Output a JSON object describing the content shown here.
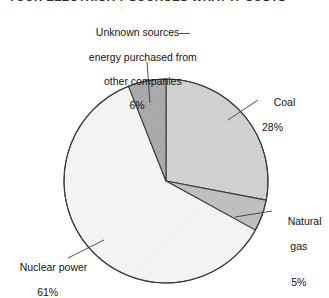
{
  "figure": {
    "title": "YOUR ELECTRICITY SOURCES     WHAT IT COSTS",
    "background": "#ffffff",
    "outline_color": "#3c3c3c"
  },
  "chart_data": {
    "type": "pie",
    "title": "YOUR ELECTRICITY SOURCES",
    "xlabel": "",
    "ylabel": "",
    "units": "percent",
    "start_angle_deg": 0,
    "direction": "clockwise",
    "center": {
      "x": 166,
      "y": 181
    },
    "radius": 102,
    "total": 100,
    "categories": [
      "Coal",
      "Natural gas",
      "Nuclear power",
      "Unknown sources—energy purchased from other companies"
    ],
    "values": [
      28,
      5,
      61,
      6
    ],
    "slices": [
      {
        "name": "coal",
        "label": "Coal",
        "value": 28,
        "percent_text": "28%",
        "color": "#cfcfcf",
        "start_deg": 0,
        "end_deg": 100.8,
        "leader": {
          "x1": 228,
          "y1": 120,
          "x2": 258,
          "y2": 100
        }
      },
      {
        "name": "natural-gas",
        "label": "Natural\ngas",
        "label_line1": "Natural",
        "label_line2": "gas",
        "value": 5,
        "percent_text": "5%",
        "color": "#bdbdbd",
        "start_deg": 100.8,
        "end_deg": 118.8,
        "leader": {
          "x1": 235,
          "y1": 217,
          "x2": 272,
          "y2": 211
        }
      },
      {
        "name": "nuclear-power",
        "label": "Nuclear power",
        "value": 61,
        "percent_text": "61%",
        "color": "#f4f4f2",
        "start_deg": 118.8,
        "end_deg": 338.4,
        "leader": {
          "x1": 104,
          "y1": 240,
          "x2": 68,
          "y2": 258
        }
      },
      {
        "name": "unknown-sources",
        "label": "Unknown sources—\nenergy purchased from\nother companies",
        "label_line1": "Unknown sources—",
        "label_line2": "energy purchased from",
        "label_line3": "other companies",
        "value": 6,
        "percent_text": "6%",
        "color": "#a9a9a9",
        "start_deg": 338.4,
        "end_deg": 360,
        "leader": {
          "x1": 150,
          "y1": 103,
          "x2": 147,
          "y2": 62
        }
      }
    ],
    "legend": "inline-callouts",
    "grid": false
  }
}
